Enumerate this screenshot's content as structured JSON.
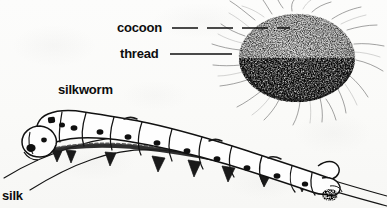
{
  "figure": {
    "width": 387,
    "height": 208,
    "style": "scanned black-and-white pen-and-ink line drawing on off-white paper",
    "background_color": "#fdfdfc",
    "ink_color": "#111111"
  },
  "labels": {
    "cocoon": "cocoon",
    "thread": "thread",
    "silkworm": "silkworm",
    "silk": "silk"
  },
  "leaders": {
    "cocoon": {
      "style": "dashed",
      "from_x": 172,
      "from_y": 28,
      "to_x": 290,
      "to_y": 28
    },
    "thread": {
      "style": "solid",
      "from_x": 170,
      "from_y": 54,
      "to_x": 232,
      "to_y": 54
    }
  },
  "illustration": {
    "cocoon": {
      "name": "cocoon",
      "description": "dense stippled oval mass, shaded darker along the lower edge, with fine silk thread wisps radiating outward in all directions",
      "center_x": 297,
      "center_y": 58,
      "radius_x": 58,
      "radius_y": 44
    },
    "silkworm": {
      "name": "silkworm caterpillar",
      "description": "segmented caterpillar in profile crawling left-to-right along an arched branch; rounded head at lower left with dark eye markings, body made of plump segments each bearing a dark oval spiracle spot, short prolegs beneath, and a pointed anal horn at the tail end on the right",
      "segment_count": 10,
      "spot_count": 9,
      "head_x": 38,
      "tail_x": 330
    },
    "branch": {
      "name": "branch",
      "description": "two long curved parallel lines forming a twig that arcs up from the lower left, peaks near the middle, and descends to the lower right",
      "start_x": 4,
      "peak_x": 150,
      "end_x": 387
    }
  }
}
